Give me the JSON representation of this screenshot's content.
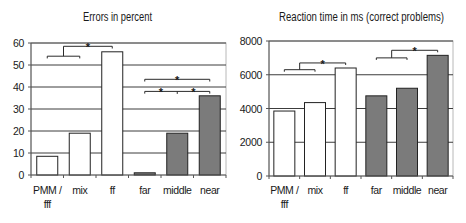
{
  "chart_data": [
    {
      "id": "errors",
      "type": "bar",
      "title": "Errors in percent",
      "xlabel": "",
      "ylabel": "",
      "ylim": [
        0,
        60
      ],
      "yticks": [
        0,
        10,
        20,
        30,
        40,
        50,
        60
      ],
      "ytick_labels": [
        "0",
        "10",
        "20",
        "30",
        "40",
        "50",
        "60"
      ],
      "grid": true,
      "legend": null,
      "categories": [
        "PMM / fff",
        "mix",
        "ff",
        "far",
        "middle",
        "near"
      ],
      "x_tick_labels": [
        [
          "PMM /",
          "fff"
        ],
        [
          "mix"
        ],
        [
          "ff"
        ],
        [
          "far"
        ],
        [
          "middle"
        ],
        [
          "near"
        ]
      ],
      "series": [
        {
          "name": "Errors (%)",
          "values": [
            8.5,
            19,
            56,
            1,
            19,
            36
          ],
          "colors": [
            "#ffffff",
            "#ffffff",
            "#ffffff",
            "#7b7b7b",
            "#7b7b7b",
            "#7b7b7b"
          ]
        }
      ],
      "annotations": [
        {
          "type": "bracket",
          "from": 0,
          "to": 1,
          "y": 54,
          "from_drop": 53,
          "to_drop": 53,
          "mid_ticks": [],
          "stars_at": [],
          "label": "*"
        },
        {
          "type": "bracket",
          "from": 0.5,
          "to": 2,
          "y": 58.5,
          "from_drop": 54,
          "to_drop": 57.5,
          "mid_ticks": [],
          "stars_at": [
            1.25
          ],
          "label": "*"
        },
        {
          "type": "bracket",
          "from": 3,
          "to": 5,
          "y": 43.5,
          "from_drop": 42.5,
          "to_drop": 42.5,
          "mid_ticks": [],
          "stars_at": [
            4
          ],
          "label": "*"
        },
        {
          "type": "bracket",
          "from": 3,
          "to": 5,
          "y": 38,
          "from_drop": 37,
          "to_drop": 37,
          "mid_ticks": [
            4
          ],
          "stars_at": [
            3.5,
            4.5
          ],
          "label": "*"
        }
      ]
    },
    {
      "id": "reaction-time",
      "type": "bar",
      "title": "Reaction time in ms (correct problems)",
      "xlabel": "",
      "ylabel": "",
      "ylim": [
        0,
        8000
      ],
      "yticks": [
        0,
        2000,
        4000,
        6000,
        8000
      ],
      "ytick_labels": [
        "0",
        "2000",
        "4000",
        "6000",
        "8000"
      ],
      "grid": true,
      "legend": null,
      "categories": [
        "PMM / fff",
        "mix",
        "ff",
        "far",
        "middle",
        "near"
      ],
      "x_tick_labels": [
        [
          "PMM /",
          "fff"
        ],
        [
          "mix"
        ],
        [
          "ff"
        ],
        [
          "far"
        ],
        [
          "middle"
        ],
        [
          "near"
        ]
      ],
      "series": [
        {
          "name": "Reaction time (ms)",
          "values": [
            3850,
            4350,
            6400,
            4750,
            5200,
            7150
          ],
          "colors": [
            "#ffffff",
            "#ffffff",
            "#ffffff",
            "#7b7b7b",
            "#7b7b7b",
            "#7b7b7b"
          ]
        }
      ],
      "annotations": [
        {
          "type": "bracket",
          "from": 0,
          "to": 1,
          "y": 6300,
          "from_drop": 6180,
          "to_drop": 6180,
          "mid_ticks": [],
          "stars_at": [],
          "label": "*"
        },
        {
          "type": "bracket",
          "from": 0.5,
          "to": 2,
          "y": 6700,
          "from_drop": 6300,
          "to_drop": 6580,
          "mid_ticks": [],
          "stars_at": [
            1.25
          ],
          "label": "*"
        },
        {
          "type": "bracket",
          "from": 3,
          "to": 4,
          "y": 7000,
          "from_drop": 6880,
          "to_drop": 6880,
          "mid_ticks": [],
          "stars_at": [],
          "label": "*"
        },
        {
          "type": "bracket",
          "from": 3.5,
          "to": 5,
          "y": 7450,
          "from_drop": 7000,
          "to_drop": 7330,
          "mid_ticks": [],
          "stars_at": [
            4.25
          ],
          "label": "*"
        }
      ]
    }
  ]
}
